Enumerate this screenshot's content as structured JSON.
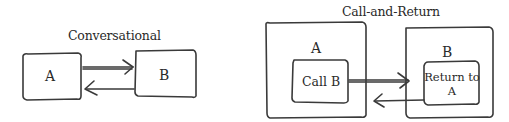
{
  "conversational": {
    "title": "Conversational",
    "box_a": {
      "label": "A"
    },
    "box_b": {
      "label": "B"
    },
    "arrows": [
      {
        "from": "A",
        "to": "B",
        "direction": "right"
      },
      {
        "from": "B",
        "to": "A",
        "direction": "left"
      }
    ]
  },
  "call_and_return": {
    "title": "Call-and-Return",
    "box_a": {
      "label": "A",
      "inner_label": "Call B"
    },
    "box_b": {
      "label": "B",
      "inner_label_line1": "Return to",
      "inner_label_line2": "A"
    },
    "arrows": [
      {
        "from": "Call B",
        "to": "Return to A",
        "direction": "right"
      },
      {
        "from": "Return to A",
        "to": "A",
        "direction": "left"
      }
    ]
  },
  "colors": {
    "stroke": "#3a3a3a",
    "background": "#ffffff"
  }
}
